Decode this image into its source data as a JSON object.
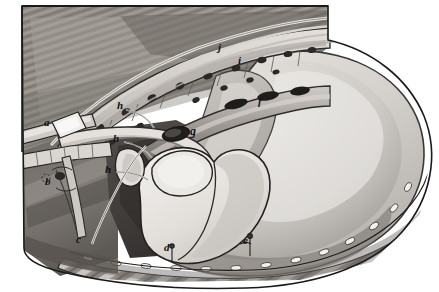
{
  "figure": {
    "medium": "pencil and wash drawing",
    "palette": {
      "background": "#ffffff",
      "ink_outline": "#1a1a1a",
      "muscle_dark": "#6f6a66",
      "muscle_mid": "#8d8884",
      "muscle_light": "#b8b3ae",
      "pleura_shadow": "#4a4845",
      "lung_light": "#dedcd8",
      "lung_mid": "#c6c3bf",
      "pericardium_pale": "#e9e7e3",
      "rib_pale": "#d6d2cc",
      "vessel_gray": "#9a9590",
      "cavity_deep": "#3c3a38",
      "suture_white": "#f2f0ec"
    },
    "labels": [
      {
        "id": "a",
        "text": "a",
        "x": 44,
        "y": 123,
        "size": 11,
        "structure": "cannulated vessel / tube at left margin"
      },
      {
        "id": "b",
        "text": "b",
        "x": 45,
        "y": 182,
        "size": 11,
        "structure": "lower cannula stump"
      },
      {
        "id": "c",
        "text": "c",
        "x": 76,
        "y": 240,
        "size": 11,
        "structure": "inferior pericardial edge / retracted margin"
      },
      {
        "id": "d",
        "text": "d",
        "x": 164,
        "y": 248,
        "size": 11,
        "structure": "sutured diaphragmatic incision line"
      },
      {
        "id": "e",
        "text": "e",
        "x": 243,
        "y": 241,
        "size": 11,
        "structure": "suture on diaphragm"
      },
      {
        "id": "f",
        "text": "f",
        "x": 258,
        "y": 102,
        "size": 11,
        "structure": "intercostal vessel bundle"
      },
      {
        "id": "g",
        "text": "g",
        "x": 190,
        "y": 131,
        "size": 11,
        "structure": "great vessel stump / pericardial reflection"
      },
      {
        "id": "h1",
        "text": "h",
        "x": 117,
        "y": 106,
        "size": 11,
        "structure": "pericardial retraction suture (upper)"
      },
      {
        "id": "h2",
        "text": "h",
        "x": 113,
        "y": 139,
        "size": 11,
        "structure": "pericardial retraction suture (middle)"
      },
      {
        "id": "h3",
        "text": "h",
        "x": 105,
        "y": 170,
        "size": 11,
        "structure": "pericardial retraction suture (lower)"
      },
      {
        "id": "i",
        "text": "i",
        "x": 238,
        "y": 61,
        "size": 11,
        "structure": "intercostal space marker"
      },
      {
        "id": "j",
        "text": "j",
        "x": 218,
        "y": 49,
        "size": 11,
        "structure": "rib marker"
      }
    ]
  }
}
